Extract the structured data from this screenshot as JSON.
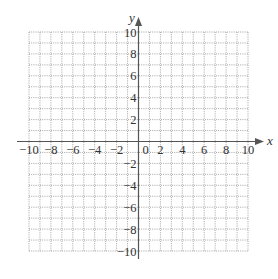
{
  "figure": {
    "type": "coordinate-grid",
    "x_axis": {
      "label": "x",
      "min": -10,
      "max": 10,
      "tick_labels": [
        "−10",
        "−8",
        "−6",
        "−4",
        "−2",
        "0",
        "2",
        "4",
        "6",
        "8",
        "10"
      ],
      "tick_values": [
        -10,
        -8,
        -6,
        -4,
        -2,
        0,
        2,
        4,
        6,
        8,
        10
      ]
    },
    "y_axis": {
      "label": "y",
      "min": -10,
      "max": 10,
      "tick_labels": [
        "10",
        "8",
        "6",
        "4",
        "2",
        "−2",
        "−4",
        "−6",
        "−8",
        "−10"
      ],
      "tick_values": [
        10,
        8,
        6,
        4,
        2,
        -2,
        -4,
        -6,
        -8,
        -10
      ]
    },
    "grid": {
      "step": 1,
      "style": "dotted"
    },
    "colors": {
      "axis": "#555555",
      "grid": "#9a9a9a",
      "text": "#333333"
    }
  }
}
